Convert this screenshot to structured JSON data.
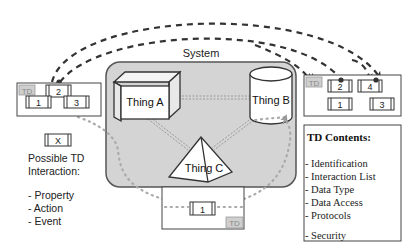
{
  "system": {
    "label": "System",
    "fill": "#d4d4d4",
    "stroke": "#555555"
  },
  "things": [
    {
      "id": "thing-a",
      "label": "Thing A",
      "shape": "cube"
    },
    {
      "id": "thing-b",
      "label": "Thing B",
      "shape": "cylinder"
    },
    {
      "id": "thing-c",
      "label": "Thing C",
      "shape": "pyramid"
    }
  ],
  "td_left": {
    "tag": "TD",
    "interactions": [
      "2",
      "1",
      "3"
    ]
  },
  "td_right": {
    "tag": "TD",
    "interactions": [
      "2",
      "4",
      "1",
      "3"
    ]
  },
  "td_bottom": {
    "tag": "TD",
    "interactions": [
      "1"
    ]
  },
  "legend": {
    "symbol": "X",
    "title_line1": "Possible TD",
    "title_line2": "Interaction:",
    "items": [
      "- Property",
      "- Action",
      "- Event"
    ]
  },
  "td_contents": {
    "title": "TD Contents:",
    "items": [
      "- Identification",
      "- Interaction List",
      "- Data Type",
      "- Data Access",
      "- Protocols",
      "- Security"
    ]
  },
  "colors": {
    "line": "#333333",
    "dotted": "#aaaaaa",
    "tag_fill": "#cfcfcf",
    "tag_text": "#888888"
  }
}
